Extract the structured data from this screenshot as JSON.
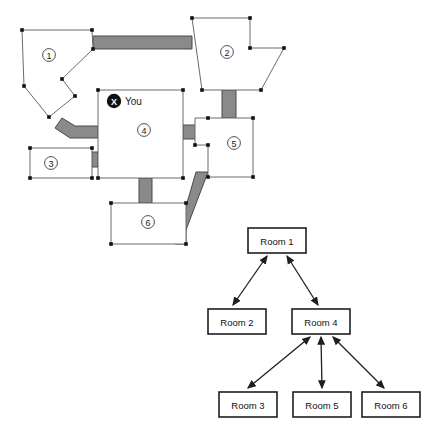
{
  "page": {
    "background_color": "#ffffff",
    "width": 425,
    "height": 435
  },
  "map": {
    "name": "floor-plan",
    "colors": {
      "room_fill": "#ffffff",
      "room_stroke": "#6b6b6b",
      "corridor_fill": "#8a8a8a",
      "corridor_stroke": "#4a4a4a",
      "vertex": "#111111",
      "badge_stroke": "#3a3a3a",
      "marker_fill": "#111111",
      "marker_glyph_color": "#ffffff"
    },
    "player_marker": {
      "glyph": "X",
      "label": "You",
      "icon_name": "player-position-marker",
      "x": 114,
      "y": 101
    },
    "rooms": [
      {
        "id": "room-1",
        "number": "1",
        "badge_x": 49,
        "badge_y": 55,
        "points": "22,30 92,30 93,49 62,79 75,96 49,117 24,86",
        "vertices": [
          [
            22,
            30
          ],
          [
            92,
            30
          ],
          [
            93,
            49
          ],
          [
            62,
            79
          ],
          [
            75,
            96
          ],
          [
            49,
            117
          ],
          [
            24,
            86
          ]
        ]
      },
      {
        "id": "room-2",
        "number": "2",
        "badge_x": 227,
        "badge_y": 52,
        "points": "192,18 250,18 250,48 284,48 261,90 202,90",
        "vertices": [
          [
            192,
            18
          ],
          [
            250,
            18
          ],
          [
            250,
            48
          ],
          [
            284,
            48
          ],
          [
            261,
            90
          ],
          [
            202,
            90
          ]
        ]
      },
      {
        "id": "room-3",
        "number": "3",
        "badge_x": 51,
        "badge_y": 163,
        "points": "30,148 92,148 92,178 30,178",
        "vertices": [
          [
            30,
            148
          ],
          [
            92,
            148
          ],
          [
            92,
            178
          ],
          [
            30,
            178
          ]
        ]
      },
      {
        "id": "room-4",
        "number": "4",
        "badge_x": 144,
        "badge_y": 130,
        "points": "98,90 183,90 183,178 98,178",
        "vertices": [
          [
            98,
            90
          ],
          [
            183,
            90
          ],
          [
            183,
            178
          ],
          [
            98,
            178
          ]
        ]
      },
      {
        "id": "room-5",
        "number": "5",
        "badge_x": 234,
        "badge_y": 143,
        "points": "208,118 253,118 253,177 208,177 208,145 195,145 195,118",
        "vertices": [
          [
            208,
            118
          ],
          [
            253,
            118
          ],
          [
            253,
            177
          ],
          [
            208,
            177
          ],
          [
            208,
            145
          ],
          [
            195,
            145
          ]
        ]
      },
      {
        "id": "room-6",
        "number": "6",
        "badge_x": 148,
        "badge_y": 222,
        "points": "111,203 186,203 186,244 111,244",
        "vertices": [
          [
            111,
            203
          ],
          [
            186,
            203
          ],
          [
            186,
            244
          ],
          [
            111,
            244
          ]
        ]
      }
    ],
    "corridors": [
      {
        "id": "corridor-1-2",
        "from": "room-1",
        "to": "room-2",
        "points": "93,36 192,36 192,49 93,49"
      },
      {
        "id": "corridor-1-4",
        "from": "room-1",
        "to": "room-4",
        "points": "62,118 75,126 98,126 98,138 70,138 55,128"
      },
      {
        "id": "corridor-3-4",
        "from": "room-3",
        "to": "room-4",
        "points": "92,152 98,152 98,167 92,167"
      },
      {
        "id": "corridor-4-5",
        "from": "room-4",
        "to": "room-5",
        "points": "183,125 208,125 208,139 183,139"
      },
      {
        "id": "corridor-2-5",
        "from": "room-2",
        "to": "room-5",
        "points": "222,90 236,90 236,118 222,118"
      },
      {
        "id": "corridor-4-6",
        "from": "room-4",
        "to": "room-6",
        "points": "139,178 152,178 152,203 139,203"
      },
      {
        "id": "corridor-5-6",
        "from": "room-5",
        "to": "room-6",
        "points": "196,172 208,172 186,230 186,244 175,244"
      }
    ]
  },
  "graph": {
    "name": "room-connectivity-graph",
    "colors": {
      "node_fill": "#ffffff",
      "node_stroke": "#1f1f1f",
      "edge_stroke": "#1f1f1f"
    },
    "nodes": [
      {
        "id": "node-room-1",
        "label": "Room 1",
        "x": 248,
        "y": 228,
        "w": 58,
        "h": 25
      },
      {
        "id": "node-room-2",
        "label": "Room 2",
        "x": 208,
        "y": 309,
        "w": 58,
        "h": 25
      },
      {
        "id": "node-room-4",
        "label": "Room 4",
        "x": 292,
        "y": 309,
        "w": 58,
        "h": 25
      },
      {
        "id": "node-room-3",
        "label": "Room 3",
        "x": 219,
        "y": 392,
        "w": 58,
        "h": 25
      },
      {
        "id": "node-room-5",
        "label": "Room 5",
        "x": 293,
        "y": 392,
        "w": 58,
        "h": 25
      },
      {
        "id": "node-room-6",
        "label": "Room 6",
        "x": 362,
        "y": 392,
        "w": 58,
        "h": 25
      }
    ],
    "edges": [
      {
        "id": "edge-1-2",
        "from": "node-room-1",
        "to": "node-room-2",
        "bidirectional": true,
        "x1": 267,
        "y1": 256,
        "x2": 233,
        "y2": 305
      },
      {
        "id": "edge-1-4",
        "from": "node-room-1",
        "to": "node-room-4",
        "bidirectional": true,
        "x1": 287,
        "y1": 256,
        "x2": 318,
        "y2": 305
      },
      {
        "id": "edge-4-3",
        "from": "node-room-4",
        "to": "node-room-3",
        "bidirectional": true,
        "x1": 310,
        "y1": 337,
        "x2": 248,
        "y2": 388
      },
      {
        "id": "edge-4-5",
        "from": "node-room-4",
        "to": "node-room-5",
        "bidirectional": true,
        "x1": 321,
        "y1": 337,
        "x2": 322,
        "y2": 388
      },
      {
        "id": "edge-4-6",
        "from": "node-room-4",
        "to": "node-room-6",
        "bidirectional": true,
        "x1": 333,
        "y1": 337,
        "x2": 384,
        "y2": 388
      }
    ]
  }
}
